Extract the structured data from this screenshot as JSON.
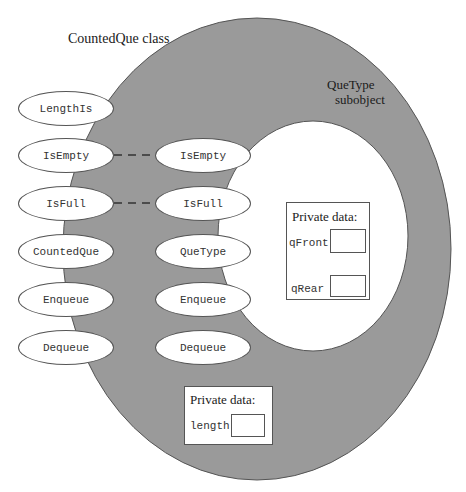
{
  "labels": {
    "outer_class": "CountedQue class",
    "subobject_line1": "QueType",
    "subobject_line2": "subobject"
  },
  "colors": {
    "outer_fill": "#9a9a9a",
    "inner_fill": "#ffffff",
    "outline": "#555555"
  },
  "counted_que_methods": [
    "LengthIs",
    "IsEmpty",
    "IsFull",
    "CountedQue",
    "Enqueue",
    "Dequeue"
  ],
  "que_type_methods": [
    "IsEmpty",
    "IsFull",
    "QueType",
    "Enqueue",
    "Dequeue"
  ],
  "links": [
    {
      "from": "IsEmpty",
      "to": "IsEmpty",
      "style": "dashed"
    },
    {
      "from": "IsFull",
      "to": "IsFull",
      "style": "dashed"
    }
  ],
  "que_type_private": {
    "title": "Private data:",
    "fields": [
      "qFront",
      "qRear"
    ]
  },
  "counted_que_private": {
    "title": "Private data:",
    "fields": [
      "length"
    ]
  }
}
